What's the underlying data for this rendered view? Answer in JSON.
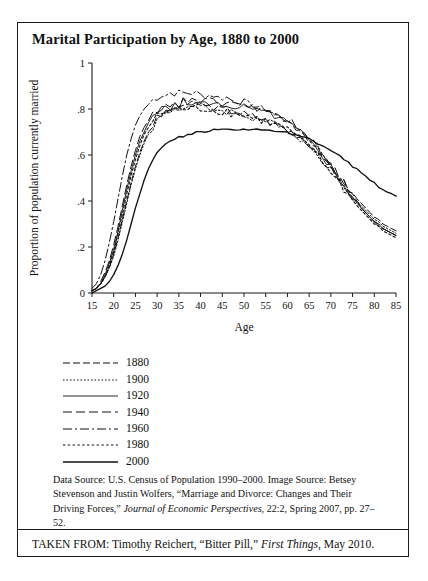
{
  "figure": {
    "title": "Marital Participation by Age, 1880 to 2000",
    "source_note_part1": "Data Source: U.S. Census of Population 1990–2000. Image Source: Betsey Stevenson and Justin Wolfers, “Marriage and Divorce: Changes and Their Driving Forces,” ",
    "source_note_italic": "Journal of Economic Perspectives",
    "source_note_part2": ", 22:2, Spring 2007, pp. 27–52.",
    "attribution_part1": "TAKEN FROM: Timothy Reichert, “Bitter Pill,” ",
    "attribution_italic": "First Things",
    "attribution_part2": ", May 2010."
  },
  "chart_data": {
    "type": "line",
    "title": "Marital Participation by Age, 1880 to 2000",
    "xlabel": "Age",
    "ylabel": "Proportion of population currently married",
    "xlim": [
      15,
      85
    ],
    "ylim": [
      0,
      1
    ],
    "xticks": [
      15,
      20,
      25,
      30,
      35,
      40,
      45,
      50,
      55,
      60,
      65,
      70,
      75,
      80,
      85
    ],
    "yticks": [
      0,
      0.2,
      0.4,
      0.6,
      0.8,
      1
    ],
    "ytick_labels": [
      "0",
      ".2",
      ".4",
      ".6",
      ".8",
      "1"
    ],
    "grid": false,
    "legend_position": "below-plot-left",
    "x": [
      15,
      16,
      17,
      18,
      19,
      20,
      21,
      22,
      23,
      24,
      25,
      26,
      27,
      28,
      29,
      30,
      31,
      32,
      33,
      34,
      35,
      36,
      37,
      38,
      39,
      40,
      41,
      42,
      43,
      44,
      45,
      46,
      47,
      48,
      49,
      50,
      51,
      52,
      53,
      54,
      55,
      56,
      57,
      58,
      59,
      60,
      61,
      62,
      63,
      64,
      65,
      66,
      67,
      68,
      69,
      70,
      71,
      72,
      73,
      74,
      75,
      76,
      77,
      78,
      79,
      80,
      81,
      82,
      83,
      84,
      85
    ],
    "series": [
      {
        "name": "1880",
        "dash": "7,3",
        "width": 1.0,
        "values": [
          0.01,
          0.02,
          0.04,
          0.07,
          0.11,
          0.17,
          0.24,
          0.32,
          0.4,
          0.48,
          0.55,
          0.61,
          0.66,
          0.7,
          0.73,
          0.76,
          0.77,
          0.79,
          0.8,
          0.81,
          0.81,
          0.82,
          0.82,
          0.82,
          0.82,
          0.82,
          0.81,
          0.81,
          0.81,
          0.8,
          0.8,
          0.8,
          0.79,
          0.79,
          0.78,
          0.78,
          0.77,
          0.77,
          0.76,
          0.76,
          0.75,
          0.74,
          0.74,
          0.73,
          0.72,
          0.71,
          0.7,
          0.69,
          0.68,
          0.66,
          0.65,
          0.63,
          0.61,
          0.59,
          0.57,
          0.55,
          0.52,
          0.5,
          0.48,
          0.45,
          0.43,
          0.41,
          0.39,
          0.37,
          0.35,
          0.33,
          0.32,
          0.3,
          0.29,
          0.28,
          0.27
        ]
      },
      {
        "name": "1900",
        "dash": "1.6,1.9",
        "width": 1.0,
        "values": [
          0.01,
          0.02,
          0.04,
          0.07,
          0.11,
          0.16,
          0.23,
          0.31,
          0.39,
          0.47,
          0.54,
          0.6,
          0.65,
          0.69,
          0.72,
          0.75,
          0.77,
          0.78,
          0.79,
          0.8,
          0.8,
          0.81,
          0.81,
          0.81,
          0.81,
          0.81,
          0.81,
          0.8,
          0.8,
          0.8,
          0.79,
          0.79,
          0.79,
          0.78,
          0.78,
          0.77,
          0.77,
          0.76,
          0.76,
          0.75,
          0.75,
          0.74,
          0.73,
          0.72,
          0.72,
          0.71,
          0.7,
          0.68,
          0.67,
          0.66,
          0.64,
          0.62,
          0.6,
          0.58,
          0.56,
          0.54,
          0.51,
          0.49,
          0.47,
          0.44,
          0.42,
          0.4,
          0.38,
          0.36,
          0.34,
          0.32,
          0.31,
          0.29,
          0.28,
          0.27,
          0.26
        ]
      },
      {
        "name": "1920",
        "dash": "",
        "width": 0.9,
        "values": [
          0.01,
          0.02,
          0.04,
          0.08,
          0.13,
          0.19,
          0.27,
          0.36,
          0.45,
          0.53,
          0.6,
          0.66,
          0.7,
          0.74,
          0.76,
          0.78,
          0.8,
          0.81,
          0.8,
          0.82,
          0.81,
          0.83,
          0.82,
          0.83,
          0.82,
          0.83,
          0.82,
          0.83,
          0.82,
          0.82,
          0.81,
          0.82,
          0.81,
          0.81,
          0.8,
          0.81,
          0.8,
          0.8,
          0.79,
          0.79,
          0.78,
          0.78,
          0.77,
          0.76,
          0.75,
          0.74,
          0.73,
          0.71,
          0.7,
          0.68,
          0.66,
          0.64,
          0.62,
          0.6,
          0.57,
          0.55,
          0.52,
          0.49,
          0.47,
          0.44,
          0.42,
          0.39,
          0.37,
          0.35,
          0.33,
          0.31,
          0.3,
          0.28,
          0.27,
          0.26,
          0.25
        ]
      },
      {
        "name": "1940",
        "dash": "9,4,9,4",
        "width": 1.0,
        "values": [
          0.01,
          0.02,
          0.05,
          0.09,
          0.14,
          0.21,
          0.29,
          0.38,
          0.47,
          0.55,
          0.62,
          0.68,
          0.72,
          0.75,
          0.78,
          0.79,
          0.81,
          0.82,
          0.81,
          0.83,
          0.82,
          0.84,
          0.83,
          0.84,
          0.83,
          0.84,
          0.83,
          0.84,
          0.83,
          0.83,
          0.82,
          0.83,
          0.82,
          0.82,
          0.81,
          0.82,
          0.81,
          0.81,
          0.8,
          0.8,
          0.79,
          0.79,
          0.78,
          0.77,
          0.76,
          0.75,
          0.74,
          0.72,
          0.71,
          0.69,
          0.67,
          0.65,
          0.63,
          0.6,
          0.58,
          0.55,
          0.53,
          0.5,
          0.47,
          0.45,
          0.42,
          0.4,
          0.37,
          0.35,
          0.33,
          0.31,
          0.3,
          0.28,
          0.27,
          0.26,
          0.25
        ]
      },
      {
        "name": "1960",
        "dash": "9,3,2,3",
        "width": 1.0,
        "values": [
          0.02,
          0.04,
          0.08,
          0.14,
          0.22,
          0.31,
          0.41,
          0.51,
          0.6,
          0.67,
          0.73,
          0.77,
          0.8,
          0.82,
          0.84,
          0.85,
          0.86,
          0.86,
          0.87,
          0.87,
          0.87,
          0.87,
          0.87,
          0.87,
          0.87,
          0.86,
          0.86,
          0.86,
          0.86,
          0.85,
          0.85,
          0.85,
          0.84,
          0.84,
          0.83,
          0.83,
          0.82,
          0.82,
          0.81,
          0.8,
          0.8,
          0.79,
          0.78,
          0.77,
          0.76,
          0.75,
          0.74,
          0.72,
          0.71,
          0.69,
          0.67,
          0.65,
          0.63,
          0.61,
          0.58,
          0.56,
          0.53,
          0.5,
          0.48,
          0.45,
          0.42,
          0.4,
          0.37,
          0.35,
          0.33,
          0.31,
          0.29,
          0.28,
          0.27,
          0.26,
          0.25
        ]
      },
      {
        "name": "1980",
        "dash": "2.4,2.4",
        "width": 1.1,
        "values": [
          0.01,
          0.02,
          0.04,
          0.07,
          0.12,
          0.18,
          0.26,
          0.34,
          0.43,
          0.51,
          0.58,
          0.64,
          0.69,
          0.72,
          0.75,
          0.77,
          0.78,
          0.79,
          0.79,
          0.8,
          0.8,
          0.8,
          0.8,
          0.8,
          0.8,
          0.8,
          0.8,
          0.8,
          0.79,
          0.79,
          0.79,
          0.79,
          0.78,
          0.78,
          0.78,
          0.77,
          0.77,
          0.76,
          0.76,
          0.75,
          0.75,
          0.74,
          0.73,
          0.73,
          0.72,
          0.71,
          0.7,
          0.68,
          0.67,
          0.65,
          0.64,
          0.62,
          0.6,
          0.57,
          0.55,
          0.53,
          0.5,
          0.48,
          0.45,
          0.43,
          0.4,
          0.38,
          0.36,
          0.34,
          0.32,
          0.3,
          0.29,
          0.27,
          0.26,
          0.25,
          0.24
        ]
      },
      {
        "name": "2000",
        "dash": "",
        "width": 1.35,
        "values": [
          0.0,
          0.01,
          0.02,
          0.03,
          0.05,
          0.08,
          0.12,
          0.17,
          0.23,
          0.3,
          0.37,
          0.43,
          0.49,
          0.54,
          0.58,
          0.61,
          0.63,
          0.65,
          0.66,
          0.67,
          0.68,
          0.68,
          0.69,
          0.69,
          0.7,
          0.7,
          0.7,
          0.7,
          0.71,
          0.71,
          0.71,
          0.71,
          0.71,
          0.71,
          0.71,
          0.71,
          0.71,
          0.71,
          0.71,
          0.71,
          0.71,
          0.71,
          0.7,
          0.7,
          0.7,
          0.7,
          0.69,
          0.69,
          0.68,
          0.68,
          0.67,
          0.66,
          0.65,
          0.64,
          0.63,
          0.62,
          0.61,
          0.6,
          0.58,
          0.57,
          0.55,
          0.54,
          0.52,
          0.51,
          0.49,
          0.48,
          0.46,
          0.45,
          0.44,
          0.43,
          0.42
        ]
      }
    ],
    "legend": [
      {
        "label": "1880",
        "dash": "7,3",
        "width": 1.0
      },
      {
        "label": "1900",
        "dash": "1.6,1.9",
        "width": 1.0
      },
      {
        "label": "1920",
        "dash": "",
        "width": 0.9
      },
      {
        "label": "1940",
        "dash": "9,4,9,4",
        "width": 1.0
      },
      {
        "label": "1960",
        "dash": "9,3,2,3",
        "width": 1.0
      },
      {
        "label": "1980",
        "dash": "2.4,2.4",
        "width": 1.1
      },
      {
        "label": "2000",
        "dash": "",
        "width": 1.35
      }
    ]
  }
}
